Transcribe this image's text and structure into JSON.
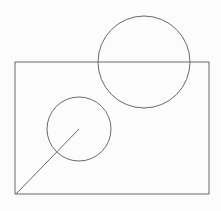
{
  "canvas": {
    "width": 221,
    "height": 211,
    "background": "#fcfcfc",
    "stroke": "#6a6a6a"
  },
  "shapes": {
    "rectangle": {
      "x": 15,
      "y": 62,
      "width": 194,
      "height": 132
    },
    "large_circle": {
      "cx": 144,
      "cy": 62,
      "r": 46
    },
    "small_circle": {
      "cx": 79,
      "cy": 129,
      "r": 32
    },
    "line": {
      "x1": 16,
      "y1": 194,
      "x2": 79,
      "y2": 129
    }
  }
}
